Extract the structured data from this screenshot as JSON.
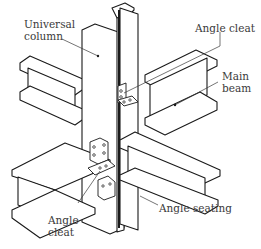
{
  "diagram": {
    "labels": {
      "universal_column": [
        "Universal",
        "column"
      ],
      "angle_cleat_top": "Angle cleat",
      "main_beam": [
        "Main",
        "beam"
      ],
      "angle_cleat_bottom": [
        "Angle",
        "cleat"
      ],
      "angle_seating": "Angle seating"
    },
    "colors": {
      "line": "#1a1a1a",
      "fill": "#ffffff",
      "label": "#3a3a3a"
    }
  }
}
